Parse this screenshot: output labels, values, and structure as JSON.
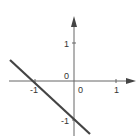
{
  "diagram": {
    "type": "coordinate-plane",
    "colors": {
      "axis": "#555555",
      "line": "#444444",
      "background": "#ffffff"
    },
    "labels": {
      "y_tick_pos": "1",
      "y_tick_neg": "-1",
      "x_tick_neg": "-1",
      "x_tick_pos": "1",
      "origin_upper": "0",
      "origin_lower": "0"
    },
    "line": {
      "description": "straight line through (-1, 0) and (0, -1)",
      "slope": -1,
      "intercept": -1
    }
  }
}
